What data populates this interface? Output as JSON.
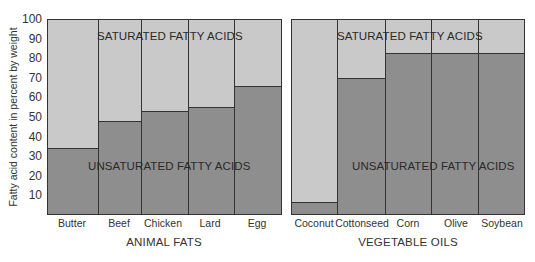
{
  "chart_data": [
    {
      "type": "bar",
      "stacked": true,
      "title": "",
      "xlabel": "ANIMAL FATS",
      "ylabel": "Fatty acid content in percent by weight",
      "ylim": [
        0,
        100
      ],
      "yticks": [
        10,
        20,
        30,
        40,
        50,
        60,
        70,
        80,
        90,
        100
      ],
      "grid": false,
      "legend": "inline labels",
      "categories": [
        "Butter",
        "Beef",
        "Chicken",
        "Lard",
        "Egg"
      ],
      "series": [
        {
          "name": "UNSATURATED FATTY ACIDS",
          "values": [
            34,
            48,
            53,
            55,
            66
          ],
          "color": "#8e8e8e"
        },
        {
          "name": "SATURATED FATTY ACIDS",
          "values": [
            66,
            52,
            47,
            45,
            34
          ],
          "color": "#c9c9c9"
        }
      ]
    },
    {
      "type": "bar",
      "stacked": true,
      "title": "",
      "xlabel": "VEGETABLE OILS",
      "ylabel": "Fatty acid content in percent by weight",
      "ylim": [
        0,
        100
      ],
      "grid": false,
      "legend": "inline labels",
      "categories": [
        "Coconut",
        "Cottonseed",
        "Corn",
        "Olive",
        "Soybean"
      ],
      "series": [
        {
          "name": "UNSATURATED FATTY ACIDS",
          "values": [
            6,
            70,
            83,
            83,
            83
          ],
          "color": "#8e8e8e"
        },
        {
          "name": "SATURATED FATTY ACIDS",
          "values": [
            94,
            30,
            17,
            17,
            17
          ],
          "color": "#c9c9c9"
        }
      ]
    }
  ],
  "axis": {
    "ylabel": "Fatty acid content in percent by weight",
    "ticks": [
      "10",
      "20",
      "30",
      "40",
      "50",
      "60",
      "70",
      "80",
      "90",
      "100"
    ]
  },
  "panels": {
    "animal": {
      "group_label": "ANIMAL FATS",
      "saturated_label": "SATURATED FATTY ACIDS",
      "unsaturated_label": "UNSATURATED FATTY ACIDS",
      "categories": [
        "Butter",
        "Beef",
        "Chicken",
        "Lard",
        "Egg"
      ]
    },
    "vegetable": {
      "group_label": "VEGETABLE OILS",
      "saturated_label": "SATURATED FATTY ACIDS",
      "unsaturated_label": "UNSATURATED FATTY ACIDS",
      "categories": [
        "Coconut",
        "Cottonseed",
        "Corn",
        "Olive",
        "Soybean"
      ]
    }
  },
  "colors": {
    "saturated": "#c9c9c9",
    "unsaturated": "#8e8e8e",
    "lines": "#333333"
  }
}
